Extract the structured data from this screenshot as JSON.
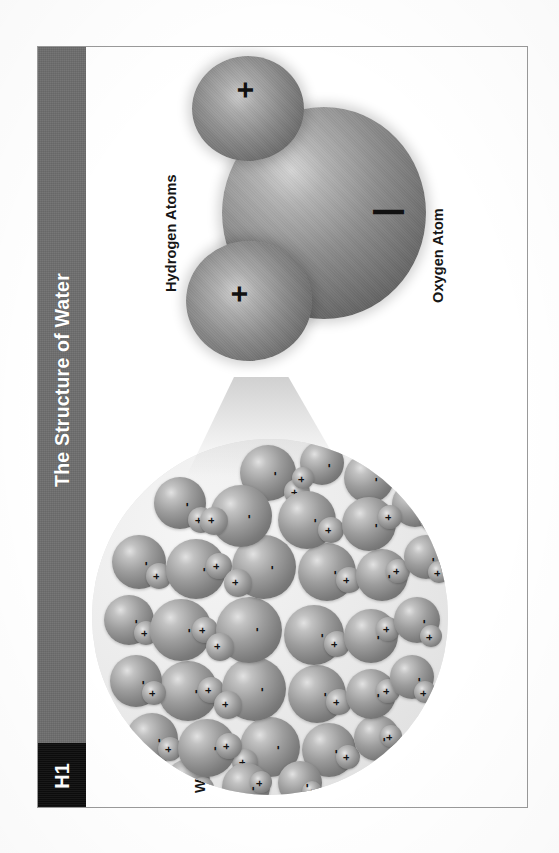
{
  "page": {
    "chapter_code": "H1",
    "title": "The Structure of Water",
    "title_bar_color": "#6e6e6e",
    "chip_color": "#0d0d0d",
    "frame_border_color": "#9a9a9a",
    "background_color": "#ffffff"
  },
  "figure": {
    "labels": {
      "hydrogen": "Hydrogen Atoms",
      "oxygen": "Oxygen Atom",
      "water": "Water Molecules"
    },
    "molecule": {
      "oxygen_charge": "|",
      "hydrogen_charge_top": "+",
      "hydrogen_charge_bottom": "+",
      "sphere_color": "#8a8a8a",
      "charge_color": "#111111"
    },
    "droplet": {
      "molecule_count": 44,
      "background_color": "#e9e9e9",
      "molecules": [
        {
          "x": 148,
          "y": 6,
          "d": 56,
          "hx": 44,
          "hy": 34,
          "hd": 26,
          "om": "-",
          "op": "+"
        },
        {
          "x": 208,
          "y": 2,
          "d": 44,
          "hx": -8,
          "hy": 26,
          "hd": 22,
          "om": "-",
          "op": "+"
        },
        {
          "x": 252,
          "y": 14,
          "d": 50,
          "hx": 36,
          "hy": -6,
          "hd": 24,
          "om": "-",
          "op": "+"
        },
        {
          "x": 62,
          "y": 38,
          "d": 52,
          "hx": 34,
          "hy": 30,
          "hd": 26,
          "om": "-",
          "op": "+"
        },
        {
          "x": 118,
          "y": 46,
          "d": 62,
          "hx": -10,
          "hy": 22,
          "hd": 28,
          "om": "-",
          "op": "+"
        },
        {
          "x": 186,
          "y": 52,
          "d": 58,
          "hx": 40,
          "hy": 26,
          "hd": 26,
          "om": "-",
          "op": "+"
        },
        {
          "x": 250,
          "y": 58,
          "d": 54,
          "hx": 36,
          "hy": 8,
          "hd": 24,
          "om": "-",
          "op": "+"
        },
        {
          "x": 300,
          "y": 42,
          "d": 46,
          "hx": 28,
          "hy": 28,
          "hd": 22,
          "om": "-",
          "op": "+"
        },
        {
          "x": 20,
          "y": 96,
          "d": 54,
          "hx": 34,
          "hy": 28,
          "hd": 26,
          "om": "-",
          "op": "+"
        },
        {
          "x": 74,
          "y": 100,
          "d": 60,
          "hx": 40,
          "hy": 14,
          "hd": 26,
          "om": "-",
          "op": "+"
        },
        {
          "x": 140,
          "y": 96,
          "d": 64,
          "hx": -8,
          "hy": 34,
          "hd": 28,
          "om": "-",
          "op": "+"
        },
        {
          "x": 206,
          "y": 104,
          "d": 58,
          "hx": 38,
          "hy": 24,
          "hd": 26,
          "om": "-",
          "op": "+"
        },
        {
          "x": 264,
          "y": 110,
          "d": 52,
          "hx": 30,
          "hy": 10,
          "hd": 24,
          "om": "-",
          "op": "+"
        },
        {
          "x": 312,
          "y": 96,
          "d": 44,
          "hx": 24,
          "hy": 26,
          "hd": 22,
          "om": "-",
          "op": "+"
        },
        {
          "x": 12,
          "y": 156,
          "d": 50,
          "hx": 30,
          "hy": 26,
          "hd": 24,
          "om": "-",
          "op": "+"
        },
        {
          "x": 58,
          "y": 160,
          "d": 62,
          "hx": 42,
          "hy": 18,
          "hd": 26,
          "om": "-",
          "op": "+"
        },
        {
          "x": 124,
          "y": 158,
          "d": 66,
          "hx": -10,
          "hy": 36,
          "hd": 28,
          "om": "-",
          "op": "+"
        },
        {
          "x": 192,
          "y": 166,
          "d": 60,
          "hx": 40,
          "hy": 26,
          "hd": 26,
          "om": "-",
          "op": "+"
        },
        {
          "x": 252,
          "y": 170,
          "d": 54,
          "hx": 32,
          "hy": 8,
          "hd": 24,
          "om": "-",
          "op": "+"
        },
        {
          "x": 302,
          "y": 158,
          "d": 46,
          "hx": 26,
          "hy": 28,
          "hd": 22,
          "om": "-",
          "op": "+"
        },
        {
          "x": 18,
          "y": 216,
          "d": 52,
          "hx": 32,
          "hy": 26,
          "hd": 24,
          "om": "-",
          "op": "+"
        },
        {
          "x": 66,
          "y": 222,
          "d": 60,
          "hx": 40,
          "hy": 16,
          "hd": 26,
          "om": "-",
          "op": "+"
        },
        {
          "x": 130,
          "y": 218,
          "d": 64,
          "hx": -8,
          "hy": 34,
          "hd": 28,
          "om": "-",
          "op": "+"
        },
        {
          "x": 196,
          "y": 226,
          "d": 58,
          "hx": 38,
          "hy": 24,
          "hd": 26,
          "om": "-",
          "op": "+"
        },
        {
          "x": 254,
          "y": 230,
          "d": 50,
          "hx": 30,
          "hy": 10,
          "hd": 24,
          "om": "-",
          "op": "+"
        },
        {
          "x": 298,
          "y": 216,
          "d": 44,
          "hx": 24,
          "hy": 26,
          "hd": 22,
          "om": "-",
          "op": "+"
        },
        {
          "x": 34,
          "y": 274,
          "d": 52,
          "hx": 32,
          "hy": 24,
          "hd": 24,
          "om": "-",
          "op": "+"
        },
        {
          "x": 86,
          "y": 280,
          "d": 58,
          "hx": 38,
          "hy": 14,
          "hd": 26,
          "om": "-",
          "op": "+"
        },
        {
          "x": 148,
          "y": 278,
          "d": 60,
          "hx": -8,
          "hy": 32,
          "hd": 26,
          "om": "-",
          "op": "+"
        },
        {
          "x": 210,
          "y": 284,
          "d": 54,
          "hx": 34,
          "hy": 22,
          "hd": 24,
          "om": "-",
          "op": "+"
        },
        {
          "x": 262,
          "y": 276,
          "d": 46,
          "hx": 26,
          "hy": 10,
          "hd": 22,
          "om": "-",
          "op": "+"
        },
        {
          "x": 74,
          "y": 320,
          "d": 44,
          "hx": 26,
          "hy": 18,
          "hd": 22,
          "om": "-",
          "op": "+"
        },
        {
          "x": 130,
          "y": 324,
          "d": 48,
          "hx": 28,
          "hy": 8,
          "hd": 22,
          "om": "-",
          "op": "+"
        },
        {
          "x": 186,
          "y": 322,
          "d": 44,
          "hx": 24,
          "hy": 20,
          "hd": 20,
          "om": "-",
          "op": "+"
        }
      ]
    }
  }
}
